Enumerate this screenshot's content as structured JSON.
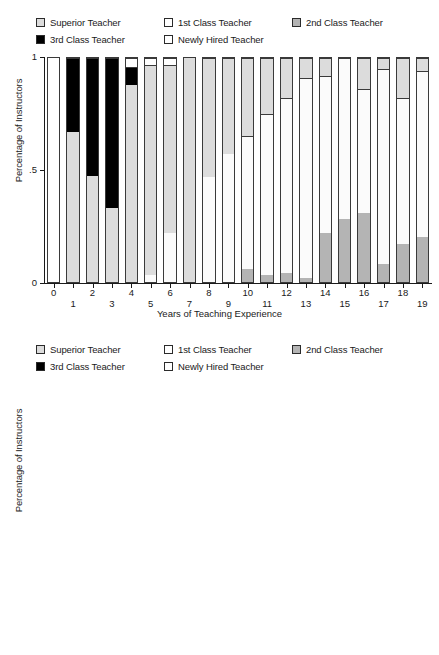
{
  "legend": {
    "items": [
      {
        "label": "Superior Teacher",
        "key": "superior",
        "color": "#dcdcdc",
        "row": 0,
        "col": 0
      },
      {
        "label": "1st Class Teacher",
        "key": "first",
        "color": "#ffffff",
        "row": 0,
        "col": 1
      },
      {
        "label": "2nd Class Teacher",
        "key": "second",
        "color": "#b4b4b4",
        "row": 0,
        "col": 2
      },
      {
        "label": "3rd Class Teacher",
        "key": "third",
        "color": "#000000",
        "row": 1,
        "col": 0
      },
      {
        "label": "Newly Hired Teacher",
        "key": "newly",
        "color": "#ffffff",
        "row": 1,
        "col": 1
      }
    ]
  },
  "colors": {
    "superior": "#dcdcdc",
    "first": "#fbfbfb",
    "second": "#b4b4b4",
    "third": "#000000",
    "newly": "#ffffff",
    "axis": "#1a1a1a",
    "bar_outline": "#3a3a3a"
  },
  "axes": {
    "ylabel": "Percentage of Instructors",
    "xlabel": "Years of Teaching Experience",
    "yticks": [
      "0",
      ".5",
      "1"
    ],
    "ytick_values": [
      0,
      0.5,
      1
    ],
    "ylim": [
      0,
      1
    ]
  },
  "chart_data": [
    {
      "type": "bar",
      "subtype": "stacked-bar-100pct",
      "id": "top-panel",
      "title": "",
      "xlabel": "Years of Teaching Experience",
      "ylabel": "Percentage of Instructors",
      "ylim": [
        0,
        1
      ],
      "yticks": [
        0,
        0.5,
        1
      ],
      "ytick_labels": [
        "0",
        ".5",
        "1"
      ],
      "grid": false,
      "legend_position": "top",
      "stack_order_bottom_to_top": [
        "second",
        "superior",
        "first",
        "third",
        "newly"
      ],
      "categories": [
        "0",
        "1",
        "2",
        "3",
        "4",
        "5",
        "6",
        "7",
        "8",
        "9",
        "10",
        "11",
        "12",
        "13",
        "14",
        "15",
        "16",
        "17",
        "18",
        "19"
      ],
      "series": [
        {
          "name": "2nd Class Teacher",
          "key": "second",
          "values": [
            0.0,
            0.0,
            0.0,
            0.0,
            0.0,
            0.0,
            0.0,
            0.0,
            0.0,
            0.0,
            0.06,
            0.03,
            0.04,
            0.02,
            0.22,
            0.28,
            0.31,
            0.08,
            0.17,
            0.2
          ]
        },
        {
          "name": "Superior Teacher",
          "key": "superior",
          "values": [
            0.0,
            0.67,
            0.475,
            0.33,
            0.88,
            0.0,
            0.0,
            0.0,
            0.0,
            0.0,
            0.0,
            0.0,
            0.0,
            0.0,
            0.0,
            0.0,
            0.0,
            0.0,
            0.0,
            0.0
          ]
        },
        {
          "name": "1st Class Teacher",
          "key": "first",
          "values": [
            0.0,
            0.0,
            0.0,
            0.0,
            0.0,
            0.94,
            0.22,
            0.0,
            0.47,
            0.57,
            0.0,
            0.0,
            0.0,
            0.0,
            0.0,
            0.0,
            0.0,
            0.0,
            0.0,
            0.0
          ]
        },
        {
          "name": "3rd Class Teacher",
          "key": "third",
          "values": [
            0.0,
            0.33,
            0.525,
            0.67,
            0.08,
            0.0,
            0.0,
            0.0,
            0.0,
            0.0,
            0.0,
            0.0,
            0.0,
            0.0,
            0.0,
            0.0,
            0.0,
            0.0,
            0.0,
            0.0
          ]
        },
        {
          "name": "Newly Hired Teacher",
          "key": "newly",
          "values": [
            1.0,
            0.0,
            0.0,
            0.0,
            0.04,
            0.06,
            0.78,
            1.0,
            0.53,
            0.43,
            0.94,
            0.97,
            0.96,
            0.98,
            0.78,
            0.72,
            0.69,
            0.92,
            0.83,
            0.8
          ]
        }
      ],
      "bars": [
        {
          "category": "0",
          "segments": [
            {
              "key": "newly",
              "value": 1.0
            }
          ]
        },
        {
          "category": "1",
          "segments": [
            {
              "key": "superior",
              "value": 0.67
            },
            {
              "key": "third",
              "value": 0.33
            }
          ]
        },
        {
          "category": "2",
          "segments": [
            {
              "key": "superior",
              "value": 0.475
            },
            {
              "key": "third",
              "value": 0.525
            }
          ]
        },
        {
          "category": "3",
          "segments": [
            {
              "key": "superior",
              "value": 0.33
            },
            {
              "key": "third",
              "value": 0.67
            }
          ]
        },
        {
          "category": "4",
          "segments": [
            {
              "key": "superior",
              "value": 0.88
            },
            {
              "key": "third",
              "value": 0.08
            },
            {
              "key": "newly",
              "value": 0.04
            }
          ]
        },
        {
          "category": "5",
          "segments": [
            {
              "key": "first",
              "value": 0.03
            },
            {
              "key": "superior",
              "value": 0.94
            },
            {
              "key": "newly",
              "value": 0.03
            }
          ]
        },
        {
          "category": "6",
          "segments": [
            {
              "key": "first",
              "value": 0.22
            },
            {
              "key": "superior",
              "value": 0.75
            },
            {
              "key": "newly",
              "value": 0.03
            }
          ]
        },
        {
          "category": "7",
          "segments": [
            {
              "key": "superior",
              "value": 1.0
            }
          ]
        },
        {
          "category": "8",
          "segments": [
            {
              "key": "first",
              "value": 0.47
            },
            {
              "key": "superior",
              "value": 0.53
            }
          ]
        },
        {
          "category": "9",
          "segments": [
            {
              "key": "first",
              "value": 0.57
            },
            {
              "key": "superior",
              "value": 0.43
            }
          ]
        },
        {
          "category": "10",
          "segments": [
            {
              "key": "second",
              "value": 0.06
            },
            {
              "key": "first",
              "value": 0.59
            },
            {
              "key": "superior",
              "value": 0.35
            }
          ]
        },
        {
          "category": "11",
          "segments": [
            {
              "key": "second",
              "value": 0.03
            },
            {
              "key": "first",
              "value": 0.72
            },
            {
              "key": "superior",
              "value": 0.25
            }
          ]
        },
        {
          "category": "12",
          "segments": [
            {
              "key": "second",
              "value": 0.04
            },
            {
              "key": "first",
              "value": 0.78
            },
            {
              "key": "superior",
              "value": 0.18
            }
          ]
        },
        {
          "category": "13",
          "segments": [
            {
              "key": "second",
              "value": 0.02
            },
            {
              "key": "first",
              "value": 0.89
            },
            {
              "key": "superior",
              "value": 0.09
            }
          ]
        },
        {
          "category": "14",
          "segments": [
            {
              "key": "second",
              "value": 0.22
            },
            {
              "key": "first",
              "value": 0.7
            },
            {
              "key": "superior",
              "value": 0.08
            }
          ]
        },
        {
          "category": "15",
          "segments": [
            {
              "key": "second",
              "value": 0.28
            },
            {
              "key": "first",
              "value": 0.72
            }
          ]
        },
        {
          "category": "16",
          "segments": [
            {
              "key": "second",
              "value": 0.31
            },
            {
              "key": "first",
              "value": 0.55
            },
            {
              "key": "superior",
              "value": 0.14
            }
          ]
        },
        {
          "category": "17",
          "segments": [
            {
              "key": "second",
              "value": 0.08
            },
            {
              "key": "first",
              "value": 0.87
            },
            {
              "key": "superior",
              "value": 0.05
            }
          ]
        },
        {
          "category": "18",
          "segments": [
            {
              "key": "second",
              "value": 0.17
            },
            {
              "key": "first",
              "value": 0.65
            },
            {
              "key": "superior",
              "value": 0.18
            }
          ]
        },
        {
          "category": "19",
          "segments": [
            {
              "key": "second",
              "value": 0.2
            },
            {
              "key": "first",
              "value": 0.74
            },
            {
              "key": "superior",
              "value": 0.06
            }
          ]
        }
      ]
    },
    {
      "type": "bar",
      "subtype": "stacked-bar-100pct",
      "id": "bottom-panel",
      "title": "",
      "xlabel": "Years of Teaching Experience",
      "ylabel": "Percentage of Instructors",
      "ylim": [
        0,
        1
      ],
      "yticks": [
        0,
        0.5,
        1
      ],
      "ytick_labels": [
        "0",
        ".5",
        "1"
      ],
      "grid": false,
      "legend_position": "top",
      "stack_order_bottom_to_top": [
        "second",
        "first",
        "superior"
      ],
      "categories": [
        "20",
        "21",
        "22",
        "23",
        "24",
        "25",
        "26",
        "27",
        "28",
        "29",
        "30",
        "31",
        "32",
        "33",
        "34",
        "35",
        "36",
        "37",
        "38",
        "39",
        "40"
      ],
      "series": [
        {
          "name": "2nd Class Teacher",
          "key": "second",
          "values": [
            0.43,
            0.35,
            0.27,
            0.14,
            0.41,
            0.42,
            0.46,
            0.3,
            0.2,
            0.67,
            0.68,
            0.5,
            0.61,
            0.68,
            0.63,
            0.88,
            0.89,
            0.64,
            0.76,
            0.72,
            1.0
          ]
        },
        {
          "name": "1st Class Teacher",
          "key": "first",
          "values": [
            0.5,
            0.63,
            0.69,
            0.86,
            0.52,
            0.53,
            0.45,
            0.58,
            0.73,
            0.2,
            0.25,
            0.5,
            0.33,
            0.24,
            0.3,
            0.12,
            0.11,
            0.36,
            0.24,
            0.2,
            0.0
          ]
        },
        {
          "name": "Superior Teacher",
          "key": "superior",
          "values": [
            0.07,
            0.02,
            0.04,
            0.0,
            0.07,
            0.05,
            0.09,
            0.12,
            0.07,
            0.13,
            0.07,
            0.0,
            0.06,
            0.08,
            0.07,
            0.0,
            0.0,
            0.0,
            0.0,
            0.08,
            0.0
          ]
        }
      ],
      "bars": [
        {
          "category": "20",
          "segments": [
            {
              "key": "second",
              "value": 0.43
            },
            {
              "key": "first",
              "value": 0.5
            },
            {
              "key": "superior",
              "value": 0.07
            }
          ]
        },
        {
          "category": "21",
          "segments": [
            {
              "key": "second",
              "value": 0.35
            },
            {
              "key": "first",
              "value": 0.65
            }
          ]
        },
        {
          "category": "22",
          "segments": [
            {
              "key": "second",
              "value": 0.27
            },
            {
              "key": "first",
              "value": 0.69
            },
            {
              "key": "superior",
              "value": 0.04
            }
          ]
        },
        {
          "category": "23",
          "segments": [
            {
              "key": "second",
              "value": 0.14
            },
            {
              "key": "first",
              "value": 0.86
            }
          ]
        },
        {
          "category": "24",
          "segments": [
            {
              "key": "second",
              "value": 0.41
            },
            {
              "key": "first",
              "value": 0.52
            },
            {
              "key": "superior",
              "value": 0.07
            }
          ]
        },
        {
          "category": "25",
          "segments": [
            {
              "key": "second",
              "value": 0.42
            },
            {
              "key": "first",
              "value": 0.53
            },
            {
              "key": "superior",
              "value": 0.05
            }
          ]
        },
        {
          "category": "26",
          "segments": [
            {
              "key": "second",
              "value": 0.46
            },
            {
              "key": "first",
              "value": 0.45
            },
            {
              "key": "superior",
              "value": 0.09
            }
          ]
        },
        {
          "category": "27",
          "segments": [
            {
              "key": "second",
              "value": 0.3
            },
            {
              "key": "first",
              "value": 0.58
            },
            {
              "key": "superior",
              "value": 0.12
            }
          ]
        },
        {
          "category": "28",
          "segments": [
            {
              "key": "second",
              "value": 0.2
            },
            {
              "key": "first",
              "value": 0.73
            },
            {
              "key": "superior",
              "value": 0.07
            }
          ]
        },
        {
          "category": "29",
          "segments": [
            {
              "key": "second",
              "value": 0.67
            },
            {
              "key": "first",
              "value": 0.2
            },
            {
              "key": "superior",
              "value": 0.13
            }
          ]
        },
        {
          "category": "30",
          "segments": [
            {
              "key": "second",
              "value": 0.68
            },
            {
              "key": "first",
              "value": 0.25
            },
            {
              "key": "superior",
              "value": 0.07
            }
          ]
        },
        {
          "category": "31",
          "segments": [
            {
              "key": "second",
              "value": 0.5
            },
            {
              "key": "first",
              "value": 0.5
            }
          ]
        },
        {
          "category": "32",
          "segments": [
            {
              "key": "second",
              "value": 0.61
            },
            {
              "key": "first",
              "value": 0.33
            },
            {
              "key": "superior",
              "value": 0.06
            }
          ]
        },
        {
          "category": "33",
          "segments": [
            {
              "key": "second",
              "value": 0.68
            },
            {
              "key": "first",
              "value": 0.24
            },
            {
              "key": "superior",
              "value": 0.08
            }
          ]
        },
        {
          "category": "34",
          "segments": [
            {
              "key": "second",
              "value": 0.63
            },
            {
              "key": "first",
              "value": 0.3
            },
            {
              "key": "superior",
              "value": 0.07
            }
          ]
        },
        {
          "category": "35",
          "segments": [
            {
              "key": "second",
              "value": 0.88
            },
            {
              "key": "first",
              "value": 0.12
            }
          ]
        },
        {
          "category": "36",
          "segments": [
            {
              "key": "second",
              "value": 0.89
            },
            {
              "key": "first",
              "value": 0.11
            }
          ]
        },
        {
          "category": "37",
          "segments": [
            {
              "key": "second",
              "value": 0.64
            },
            {
              "key": "first",
              "value": 0.36
            }
          ]
        },
        {
          "category": "38",
          "segments": [
            {
              "key": "second",
              "value": 0.76
            },
            {
              "key": "first",
              "value": 0.24
            }
          ]
        },
        {
          "category": "39",
          "segments": [
            {
              "key": "second",
              "value": 0.72
            },
            {
              "key": "first",
              "value": 0.2
            },
            {
              "key": "superior",
              "value": 0.08
            }
          ]
        },
        {
          "category": "40",
          "segments": [
            {
              "key": "second",
              "value": 1.0
            }
          ]
        }
      ]
    }
  ]
}
